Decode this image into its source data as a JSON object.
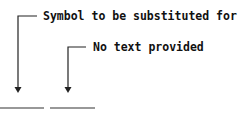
{
  "diagram": {
    "callouts": [
      {
        "label": "Symbol to be substituted for"
      },
      {
        "label": "No text provided"
      }
    ],
    "blanks": [
      {
        "name": "first-blank"
      },
      {
        "name": "second-blank"
      }
    ],
    "colors": {
      "line": "#222222",
      "text": "#111111",
      "background": "#ffffff"
    }
  }
}
